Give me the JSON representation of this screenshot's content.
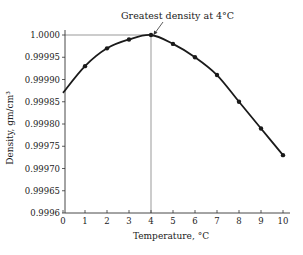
{
  "chart_data": {
    "type": "line",
    "title": "",
    "annotation": "Greatest density at 4°C",
    "xlabel": "Temperature, °C",
    "ylabel": "Density, gm/cm³",
    "x": [
      0,
      1,
      2,
      3,
      4,
      5,
      6,
      7,
      8,
      9,
      10
    ],
    "series": [
      {
        "name": "Density of water",
        "values": [
          0.99987,
          0.99993,
          0.99997,
          0.99999,
          1.0,
          0.99998,
          0.99995,
          0.99991,
          0.99985,
          0.99979,
          0.99973
        ],
        "markers_at": [
          1,
          2,
          3,
          4,
          5,
          6,
          7,
          8,
          9,
          10
        ]
      }
    ],
    "xlim": [
      0,
      10
    ],
    "ylim": [
      0.9996,
      1.0
    ],
    "xticks": [
      "0",
      "1",
      "2",
      "3",
      "4",
      "5",
      "6",
      "7",
      "8",
      "9",
      "10"
    ],
    "yticks": [
      "0.9996",
      "0.99965",
      "0.99970",
      "0.99975",
      "0.99980",
      "0.99985",
      "0.99990",
      "0.99995",
      "1.0000"
    ],
    "grid": false,
    "reference_lines": {
      "horizontal_at": 1.0,
      "vertical_at": 4
    },
    "legend": null,
    "color": "#1a1a1a"
  }
}
